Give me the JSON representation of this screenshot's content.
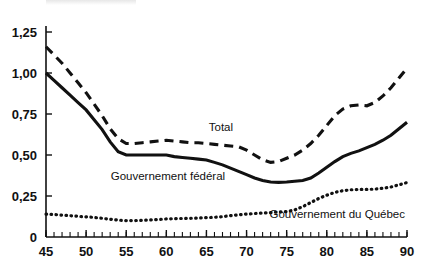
{
  "chart_data": {
    "type": "line",
    "title": "",
    "subtitle": "",
    "xlabel": "",
    "ylabel": "",
    "xlim": [
      45,
      90
    ],
    "ylim": [
      0,
      1.25
    ],
    "grid": false,
    "legend_position": "inline-annotations",
    "x_tick_labels": [
      "45",
      "50",
      "55",
      "60",
      "65",
      "70",
      "75",
      "80",
      "85",
      "90"
    ],
    "x_tick_values": [
      45,
      50,
      55,
      60,
      65,
      70,
      75,
      80,
      85,
      90
    ],
    "x_minor_tick_step": 1,
    "y_tick_labels": [
      "0",
      "0,25",
      "0,50",
      "0,75",
      "1,00",
      "1,25"
    ],
    "y_tick_values": [
      0,
      0.25,
      0.5,
      0.75,
      1.0,
      1.25
    ],
    "x": [
      45,
      46,
      47,
      48,
      49,
      50,
      51,
      52,
      53,
      54,
      55,
      56,
      57,
      58,
      59,
      60,
      61,
      62,
      63,
      64,
      65,
      66,
      67,
      68,
      69,
      70,
      71,
      72,
      73,
      74,
      75,
      76,
      77,
      78,
      79,
      80,
      81,
      82,
      83,
      84,
      85,
      86,
      87,
      88,
      89,
      90
    ],
    "series": [
      {
        "name": "Total",
        "style": "dashed",
        "color": "#111111",
        "values": [
          1.16,
          1.11,
          1.06,
          1.0,
          0.94,
          0.88,
          0.81,
          0.74,
          0.66,
          0.6,
          0.57,
          0.57,
          0.575,
          0.58,
          0.585,
          0.59,
          0.585,
          0.58,
          0.575,
          0.575,
          0.57,
          0.565,
          0.56,
          0.555,
          0.55,
          0.53,
          0.5,
          0.47,
          0.455,
          0.46,
          0.48,
          0.5,
          0.53,
          0.57,
          0.62,
          0.68,
          0.74,
          0.78,
          0.8,
          0.805,
          0.8,
          0.82,
          0.86,
          0.91,
          0.97,
          1.03
        ]
      },
      {
        "name": "Gouvernement fédéral",
        "style": "solid",
        "color": "#111111",
        "values": [
          1.0,
          0.955,
          0.91,
          0.865,
          0.82,
          0.775,
          0.715,
          0.655,
          0.58,
          0.52,
          0.5,
          0.5,
          0.5,
          0.5,
          0.5,
          0.5,
          0.49,
          0.485,
          0.48,
          0.475,
          0.47,
          0.455,
          0.44,
          0.42,
          0.4,
          0.38,
          0.36,
          0.345,
          0.335,
          0.333,
          0.335,
          0.34,
          0.345,
          0.36,
          0.39,
          0.425,
          0.46,
          0.49,
          0.51,
          0.525,
          0.545,
          0.565,
          0.59,
          0.62,
          0.66,
          0.7
        ]
      },
      {
        "name": "Gouvernement du Québec",
        "style": "dotted",
        "color": "#111111",
        "values": [
          0.14,
          0.137,
          0.133,
          0.13,
          0.126,
          0.123,
          0.119,
          0.114,
          0.108,
          0.103,
          0.1,
          0.1,
          0.102,
          0.104,
          0.107,
          0.11,
          0.112,
          0.113,
          0.114,
          0.116,
          0.118,
          0.12,
          0.124,
          0.13,
          0.135,
          0.14,
          0.143,
          0.146,
          0.149,
          0.152,
          0.155,
          0.165,
          0.185,
          0.21,
          0.235,
          0.255,
          0.272,
          0.282,
          0.288,
          0.29,
          0.29,
          0.292,
          0.297,
          0.305,
          0.318,
          0.332
        ]
      }
    ],
    "annotations": [
      {
        "text": "Total",
        "x": 66.8,
        "y": 0.645
      },
      {
        "text": "Gouvernement fédéral",
        "x": 60.2,
        "y": 0.345
      },
      {
        "text": "Gouvernement du Québec",
        "x": 81.3,
        "y": 0.115
      }
    ]
  }
}
